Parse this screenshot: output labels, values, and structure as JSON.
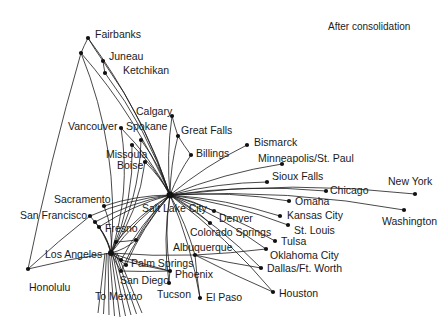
{
  "title": "After consolidation",
  "hubs": {
    "primary": "Salt Lake City",
    "secondary": "Los Angeles"
  },
  "cities": [
    {
      "id": "fairbanks",
      "name": "Fairbanks",
      "x": 88,
      "y": 38,
      "lx": 95,
      "ly": 29
    },
    {
      "id": "anchorage",
      "name": "",
      "x": 81,
      "y": 53,
      "lx": 0,
      "ly": 0
    },
    {
      "id": "juneau",
      "name": "Juneau",
      "x": 103,
      "y": 61,
      "lx": 109,
      "ly": 51
    },
    {
      "id": "ketchikan",
      "name": "Ketchikan",
      "x": 105,
      "y": 73,
      "lx": 123,
      "ly": 65
    },
    {
      "id": "calgary",
      "name": "Calgary",
      "x": 172,
      "y": 116,
      "lx": 136,
      "ly": 106
    },
    {
      "id": "vancouver",
      "name": "Vancouver",
      "x": 121,
      "y": 128,
      "lx": 68,
      "ly": 121
    },
    {
      "id": "spokane",
      "name": "Spokane",
      "x": 141,
      "y": 140,
      "lx": 126,
      "ly": 121
    },
    {
      "id": "greatfalls",
      "name": "Great Falls",
      "x": 178,
      "y": 136,
      "lx": 181,
      "ly": 125
    },
    {
      "id": "missoula",
      "name": "Missoula",
      "x": 132,
      "y": 145,
      "lx": 106,
      "ly": 149
    },
    {
      "id": "billings",
      "name": "Billings",
      "x": 191,
      "y": 155,
      "lx": 196,
      "ly": 148
    },
    {
      "id": "boise",
      "name": "Boise",
      "x": 145,
      "y": 162,
      "lx": 117,
      "ly": 160
    },
    {
      "id": "bismarck",
      "name": "Bismarck",
      "x": 247,
      "y": 145,
      "lx": 254,
      "ly": 137
    },
    {
      "id": "minneapolis",
      "name": "Minneapolis/St. Paul",
      "x": 282,
      "y": 164,
      "lx": 258,
      "ly": 153
    },
    {
      "id": "siouxfalls",
      "name": "Sioux Falls",
      "x": 267,
      "y": 182,
      "lx": 272,
      "ly": 171
    },
    {
      "id": "newyork",
      "name": "New York",
      "x": 415,
      "y": 194,
      "lx": 388,
      "ly": 176
    },
    {
      "id": "chicago",
      "name": "Chicago",
      "x": 326,
      "y": 191,
      "lx": 330,
      "ly": 185
    },
    {
      "id": "omaha",
      "name": "Omaha",
      "x": 289,
      "y": 201,
      "lx": 295,
      "ly": 196
    },
    {
      "id": "washington",
      "name": "Washington",
      "x": 404,
      "y": 210,
      "lx": 382,
      "ly": 216
    },
    {
      "id": "kansascity",
      "name": "Kansas City",
      "x": 280,
      "y": 216,
      "lx": 287,
      "ly": 210
    },
    {
      "id": "stlouis",
      "name": "St. Louis",
      "x": 288,
      "y": 225,
      "lx": 294,
      "ly": 225
    },
    {
      "id": "denver",
      "name": "Denver",
      "x": 214,
      "y": 211,
      "lx": 219,
      "ly": 213
    },
    {
      "id": "coloradosprings",
      "name": "Colorado Springs",
      "x": 210,
      "y": 223,
      "lx": 190,
      "ly": 227
    },
    {
      "id": "tulsa",
      "name": "Tulsa",
      "x": 275,
      "y": 241,
      "lx": 281,
      "ly": 236
    },
    {
      "id": "oklahomacity",
      "name": "Oklahoma City",
      "x": 266,
      "y": 249,
      "lx": 270,
      "ly": 250
    },
    {
      "id": "dallas",
      "name": "Dallas/Ft. Worth",
      "x": 261,
      "y": 268,
      "lx": 267,
      "ly": 263
    },
    {
      "id": "houston",
      "name": "Houston",
      "x": 273,
      "y": 292,
      "lx": 279,
      "ly": 288
    },
    {
      "id": "albuquerque",
      "name": "Albuquerque",
      "x": 195,
      "y": 255,
      "lx": 173,
      "ly": 242
    },
    {
      "id": "elpaso",
      "name": "El Paso",
      "x": 200,
      "y": 298,
      "lx": 206,
      "ly": 292
    },
    {
      "id": "phoenix",
      "name": "Phoenix",
      "x": 170,
      "y": 271,
      "lx": 175,
      "ly": 269
    },
    {
      "id": "tucson",
      "name": "Tucson",
      "x": 169,
      "y": 283,
      "lx": 157,
      "ly": 289
    },
    {
      "id": "sacramento",
      "name": "Sacramento",
      "x": 104,
      "y": 206,
      "lx": 54,
      "ly": 194
    },
    {
      "id": "sanfrancisco",
      "name": "San Francisco",
      "x": 90,
      "y": 216,
      "lx": 20,
      "ly": 210
    },
    {
      "id": "oakland",
      "name": "",
      "x": 95,
      "y": 222,
      "lx": 0,
      "ly": 0
    },
    {
      "id": "sanjose",
      "name": "",
      "x": 99,
      "y": 227,
      "lx": 0,
      "ly": 0
    },
    {
      "id": "fresno",
      "name": "Fresno",
      "x": 116,
      "y": 242,
      "lx": 105,
      "ly": 223
    },
    {
      "id": "fresno2",
      "name": "",
      "x": 136,
      "y": 240,
      "lx": 0,
      "ly": 0
    },
    {
      "id": "losangeles",
      "name": "Los Angeles",
      "x": 111,
      "y": 253,
      "lx": 45,
      "ly": 249
    },
    {
      "id": "palmsprings",
      "name": "Palm Springs",
      "x": 121,
      "y": 260,
      "lx": 131,
      "ly": 258
    },
    {
      "id": "ontario",
      "name": "",
      "x": 126,
      "y": 265,
      "lx": 0,
      "ly": 0
    },
    {
      "id": "sandiego",
      "name": "San Diego",
      "x": 121,
      "y": 271,
      "lx": 120,
      "ly": 275
    },
    {
      "id": "honolulu",
      "name": "Honolulu",
      "x": 28,
      "y": 269,
      "lx": 29,
      "ly": 282
    },
    {
      "id": "tomexico",
      "name": "To Mexico",
      "x": 0,
      "y": 0,
      "lx": 95,
      "ly": 291
    }
  ],
  "salt_lake_city": {
    "name": "Salt Lake City",
    "x": 170,
    "y": 195,
    "lx": 142,
    "ly": 203
  },
  "hub_spokes_slc": [
    "fairbanks",
    "anchorage",
    "juneau",
    "ketchikan",
    "calgary",
    "vancouver",
    "spokane",
    "greatfalls",
    "missoula",
    "billings",
    "boise",
    "bismarck",
    "minneapolis",
    "siouxfalls",
    "newyork",
    "chicago",
    "omaha",
    "washington",
    "kansascity",
    "stlouis",
    "denver",
    "coloradosprings",
    "tulsa",
    "oklahomacity",
    "dallas",
    "houston",
    "albuquerque",
    "elpaso",
    "phoenix",
    "tucson",
    "sacramento",
    "sanfrancisco",
    "oakland",
    "sanjose",
    "fresno",
    "fresno2",
    "losangeles",
    "palmsprings",
    "ontario",
    "sandiego"
  ],
  "hub_spokes_la": [
    "anchorage",
    "vancouver",
    "spokane",
    "missoula",
    "boise",
    "sacramento",
    "sanfrancisco",
    "oakland",
    "sanjose",
    "fresno",
    "fresno2",
    "honolulu",
    "palmsprings",
    "ontario",
    "sandiego",
    "phoenix",
    "albuquerque"
  ],
  "extra_links": [
    [
      "fairbanks",
      "anchorage"
    ],
    [
      "fairbanks",
      "juneau"
    ],
    [
      "anchorage",
      "honolulu"
    ],
    [
      "juneau",
      "ketchikan"
    ],
    [
      "sanfrancisco",
      "honolulu"
    ],
    [
      "sandiego",
      "phoenix"
    ],
    [
      "phoenix",
      "tucson"
    ],
    [
      "albuquerque",
      "elpaso"
    ],
    [
      "albuquerque",
      "oklahomacity"
    ],
    [
      "albuquerque",
      "dallas"
    ],
    [
      "albuquerque",
      "houston"
    ],
    [
      "palmsprings",
      "phoenix"
    ],
    [
      "greatfalls",
      "billings"
    ],
    [
      "calgary",
      "greatfalls"
    ],
    [
      "fresno",
      "fresno2"
    ]
  ],
  "mexico_stubs": 9
}
